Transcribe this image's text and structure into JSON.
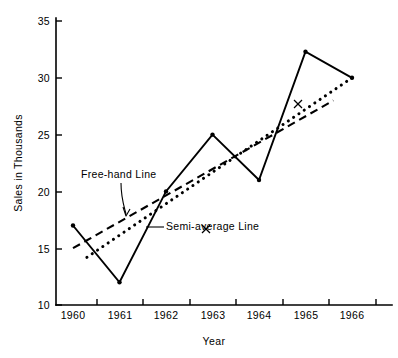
{
  "chart_data": {
    "type": "line",
    "title": "",
    "xlabel": "Year",
    "ylabel": "Sales in Thousands",
    "x": [
      1960,
      1961,
      1962,
      1963,
      1964,
      1965,
      1966
    ],
    "xtick_labels": [
      "1960",
      "1961",
      "1962",
      "1963",
      "1964",
      "1965",
      "1966"
    ],
    "ytick_labels": [
      "10",
      "15",
      "20",
      "25",
      "30",
      "35"
    ],
    "ytick_values": [
      10,
      15,
      20,
      25,
      30,
      35
    ],
    "xlim": [
      1959.6,
      1966.8
    ],
    "ylim": [
      10,
      35
    ],
    "grid": false,
    "legend": "none",
    "series": [
      {
        "name": "Sales",
        "style": "solid-with-markers",
        "values": [
          17,
          12,
          20,
          25,
          21,
          32.3,
          30
        ]
      },
      {
        "name": "Free-hand Line",
        "style": "dashed",
        "x": [
          1960,
          1965.6
        ],
        "values": [
          15,
          28
        ]
      },
      {
        "name": "Semi-average Line",
        "style": "dotted",
        "x": [
          1960.3,
          1966
        ],
        "values": [
          14.2,
          30
        ],
        "midpoint_marker": "x",
        "midpoint": [
          1963.15,
          22.1
        ]
      }
    ],
    "annotations": [
      {
        "label": "Free-hand Line",
        "points_to": "dashed-line"
      },
      {
        "label": "Semi-average Line",
        "points_to": "dotted-line"
      }
    ]
  },
  "labels": {
    "y_axis_title": "Sales in Thousands",
    "x_axis_title": "Year",
    "free_hand": "Free-hand Line",
    "semi_average": "Semi-average Line"
  },
  "colors": {
    "ink": "#000000",
    "background": "#ffffff"
  }
}
